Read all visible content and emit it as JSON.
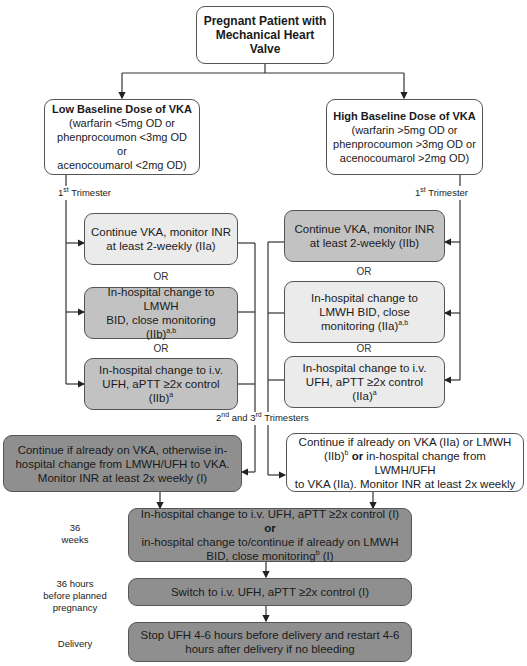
{
  "title_box": {
    "line1": "Pregnant Patient with",
    "line2": "Mechanical Heart",
    "line3": "Valve"
  },
  "low_dose": {
    "heading": "Low Baseline Dose of VKA",
    "l1": "(warfarin <5mg OD or",
    "l2": "phenprocoumon <3mg OD or",
    "l3": "acenocoumarol <2mg OD)"
  },
  "high_dose": {
    "heading": "High Baseline Dose of VKA",
    "l1": "(warfarin >5mg OD or",
    "l2": "phenprocoumon >3mg OD or",
    "l3": "acenocoumarol >2mg OD)"
  },
  "labels": {
    "first_trimester_num": "1",
    "first_trimester_sup": "st",
    "first_trimester_text": " Trimester",
    "second_num": "2",
    "second_sup": "nd",
    "and": " and 3",
    "third_sup": "rd",
    "trimesters": " Trimesters",
    "or": "OR",
    "weeks36_a": "36",
    "weeks36_b": "weeks",
    "hours36_a": "36 hours",
    "hours36_b": "before planned",
    "hours36_c": "pregnancy",
    "delivery": "Delivery"
  },
  "low_options": [
    {
      "l1": "Continue VKA, monitor INR",
      "l2": "at least 2-weekly (IIa)"
    },
    {
      "l1": "In-hospital change to LMWH",
      "l2": "BID, close monitoring (IIb)",
      "sup": "a,b"
    },
    {
      "l1": "In-hospital change to i.v.",
      "l2": "UFH, aPTT ≥2x control (IIb)",
      "sup": "a"
    }
  ],
  "high_options": [
    {
      "l1": "Continue VKA, monitor INR",
      "l2": "at least 2-weekly (IIb)"
    },
    {
      "l1": "In-hospital change to",
      "l2": "LMWH BID, close",
      "l3": "monitoring (IIa)",
      "sup": "a,b"
    },
    {
      "l1": "In-hospital change to i.v.",
      "l2": "UFH, aPTT ≥2x control",
      "l3": "(IIa)",
      "sup": "a"
    }
  ],
  "low_2nd3rd": {
    "l1": "Continue if already on VKA, otherwise in-",
    "l2": "hospital change from LMWH/UFH to VKA.",
    "l3": "Monitor INR at least 2x weekly (I)"
  },
  "high_2nd3rd": {
    "l1": "Continue if already on VKA (IIa) or LMWH",
    "l2a": "(IIb)",
    "l2sup": "b",
    "l2or": " or",
    "l2b": " in-hospital change from LWMH/UFH",
    "l3": "to VKA (IIa). Monitor INR at least 2x weekly"
  },
  "week36_box": {
    "l1a": "In-hospital change to i.v. UFH, aPTT ≥2x control (I)",
    "l1or": " or",
    "l2": "in-hospital change to/continue if already on LMWH",
    "l3a": "BID, close monitoring",
    "l3sup": "b",
    "l3b": " (I)"
  },
  "switch_box": {
    "text": "Switch to i.v. UFH, aPTT ≥2x control (I)"
  },
  "delivery_box": {
    "l1": "Stop UFH 4-6 hours before delivery and restart 4-6",
    "l2": "hours after delivery if no bleeding"
  },
  "colors": {
    "white": "#ffffff",
    "light": "#ebebeb",
    "mid": "#c2c2c2",
    "dark": "#8f8f8f",
    "line": "#333333"
  }
}
